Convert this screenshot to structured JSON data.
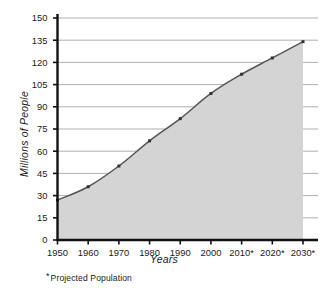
{
  "chart_data": {
    "type": "area",
    "title": "",
    "xlabel": "Years",
    "ylabel": "Millions of People",
    "x": [
      1950,
      1960,
      1970,
      1980,
      1990,
      2000,
      2010,
      2020,
      2030
    ],
    "categories": [
      "1950",
      "1960",
      "1970",
      "1980",
      "1990",
      "2000",
      "2010*",
      "2020*",
      "2030*"
    ],
    "values": [
      27,
      36,
      50,
      67,
      82,
      99,
      112,
      123,
      134
    ],
    "series": [
      {
        "name": "Population",
        "values": [
          27,
          36,
          50,
          67,
          82,
          99,
          112,
          123,
          134
        ]
      }
    ],
    "ylim": [
      0,
      150
    ],
    "yticks": [
      0,
      15,
      30,
      45,
      60,
      75,
      90,
      105,
      120,
      135,
      150
    ],
    "ytick_labels": [
      "0",
      "15",
      "30",
      "45",
      "60",
      "75",
      "90",
      "105",
      "120",
      "135",
      "150"
    ],
    "xtick_labels": [
      "1950",
      "1960",
      "1970",
      "1980",
      "1990",
      "2000",
      "2010*",
      "2020*",
      "2030*"
    ],
    "grid": true,
    "legend": "none",
    "markers": true,
    "annotations": [
      "* Projected Population"
    ],
    "colors": {
      "fill": "#d4d4d4",
      "line": "#555555",
      "marker": "#333333",
      "grid": "#9a9a9a",
      "axis": "#111111",
      "text": "#1a1a1a",
      "background": "#ffffff"
    }
  },
  "labels": {
    "y_axis_title": "Millions of People",
    "x_axis_title": "Years",
    "footnote_star": "*",
    "footnote_text": "Projected Population"
  }
}
